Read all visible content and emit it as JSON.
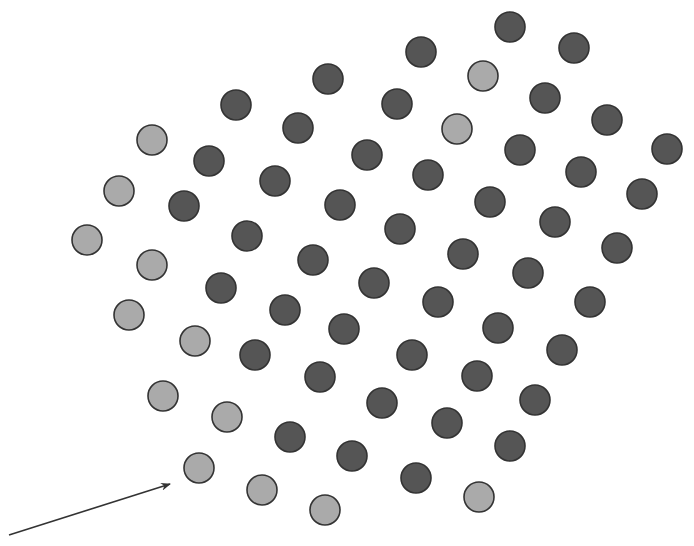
{
  "figure": {
    "width": 694,
    "height": 546,
    "dot_radius": 15,
    "colors": {
      "background": "#ffffff",
      "light_dot_fill": "#aaaaaa",
      "dark_dot_fill": "#555555",
      "dot_stroke": "#333333",
      "arrow": "#333333"
    },
    "arrow": {
      "x1": 9,
      "y1": 535,
      "x2": 170,
      "y2": 484
    },
    "dots": [
      {
        "x": 510,
        "y": 27,
        "type": "dark"
      },
      {
        "x": 574,
        "y": 48,
        "type": "dark"
      },
      {
        "x": 421,
        "y": 52,
        "type": "dark"
      },
      {
        "x": 483,
        "y": 76,
        "type": "light"
      },
      {
        "x": 328,
        "y": 79,
        "type": "dark"
      },
      {
        "x": 545,
        "y": 98,
        "type": "dark"
      },
      {
        "x": 397,
        "y": 104,
        "type": "dark"
      },
      {
        "x": 236,
        "y": 105,
        "type": "dark"
      },
      {
        "x": 457,
        "y": 129,
        "type": "light"
      },
      {
        "x": 607,
        "y": 120,
        "type": "dark"
      },
      {
        "x": 298,
        "y": 128,
        "type": "dark"
      },
      {
        "x": 152,
        "y": 140,
        "type": "light"
      },
      {
        "x": 520,
        "y": 150,
        "type": "dark"
      },
      {
        "x": 667,
        "y": 149,
        "type": "dark"
      },
      {
        "x": 367,
        "y": 155,
        "type": "dark"
      },
      {
        "x": 209,
        "y": 161,
        "type": "dark"
      },
      {
        "x": 428,
        "y": 175,
        "type": "dark"
      },
      {
        "x": 581,
        "y": 172,
        "type": "dark"
      },
      {
        "x": 275,
        "y": 181,
        "type": "dark"
      },
      {
        "x": 119,
        "y": 191,
        "type": "light"
      },
      {
        "x": 490,
        "y": 202,
        "type": "dark"
      },
      {
        "x": 642,
        "y": 194,
        "type": "dark"
      },
      {
        "x": 184,
        "y": 206,
        "type": "dark"
      },
      {
        "x": 340,
        "y": 205,
        "type": "dark"
      },
      {
        "x": 555,
        "y": 222,
        "type": "dark"
      },
      {
        "x": 400,
        "y": 229,
        "type": "dark"
      },
      {
        "x": 87,
        "y": 240,
        "type": "light"
      },
      {
        "x": 247,
        "y": 236,
        "type": "dark"
      },
      {
        "x": 617,
        "y": 248,
        "type": "dark"
      },
      {
        "x": 463,
        "y": 254,
        "type": "dark"
      },
      {
        "x": 152,
        "y": 265,
        "type": "light"
      },
      {
        "x": 313,
        "y": 260,
        "type": "dark"
      },
      {
        "x": 528,
        "y": 273,
        "type": "dark"
      },
      {
        "x": 374,
        "y": 283,
        "type": "dark"
      },
      {
        "x": 221,
        "y": 288,
        "type": "dark"
      },
      {
        "x": 590,
        "y": 302,
        "type": "dark"
      },
      {
        "x": 438,
        "y": 302,
        "type": "dark"
      },
      {
        "x": 129,
        "y": 315,
        "type": "light"
      },
      {
        "x": 285,
        "y": 310,
        "type": "dark"
      },
      {
        "x": 498,
        "y": 328,
        "type": "dark"
      },
      {
        "x": 344,
        "y": 329,
        "type": "dark"
      },
      {
        "x": 195,
        "y": 341,
        "type": "light"
      },
      {
        "x": 562,
        "y": 350,
        "type": "dark"
      },
      {
        "x": 412,
        "y": 355,
        "type": "dark"
      },
      {
        "x": 255,
        "y": 355,
        "type": "dark"
      },
      {
        "x": 477,
        "y": 376,
        "type": "dark"
      },
      {
        "x": 320,
        "y": 377,
        "type": "dark"
      },
      {
        "x": 535,
        "y": 400,
        "type": "dark"
      },
      {
        "x": 163,
        "y": 396,
        "type": "light"
      },
      {
        "x": 382,
        "y": 403,
        "type": "dark"
      },
      {
        "x": 227,
        "y": 417,
        "type": "light"
      },
      {
        "x": 447,
        "y": 423,
        "type": "dark"
      },
      {
        "x": 290,
        "y": 437,
        "type": "dark"
      },
      {
        "x": 510,
        "y": 446,
        "type": "dark"
      },
      {
        "x": 352,
        "y": 456,
        "type": "dark"
      },
      {
        "x": 199,
        "y": 468,
        "type": "light"
      },
      {
        "x": 416,
        "y": 478,
        "type": "dark"
      },
      {
        "x": 262,
        "y": 490,
        "type": "light"
      },
      {
        "x": 479,
        "y": 497,
        "type": "light"
      },
      {
        "x": 325,
        "y": 510,
        "type": "light"
      }
    ]
  }
}
